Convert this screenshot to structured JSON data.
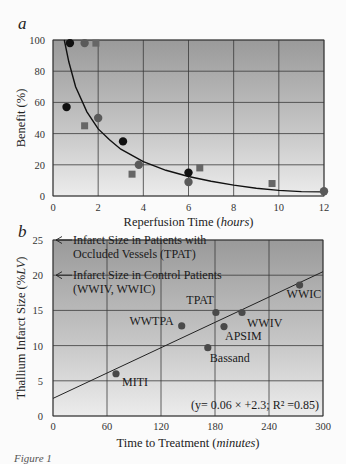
{
  "figure": {
    "caption_fragment": "Figure 1"
  },
  "chart_data": [
    {
      "panel": "a",
      "type": "scatter",
      "title": "",
      "xlabel": "Reperfusion Time (hours)",
      "xlabel_main": "Reperfusion Time (",
      "xlabel_italic": "hours",
      "xlabel_end": ")",
      "ylabel": "Benefit (%)",
      "xlim": [
        0,
        12
      ],
      "ylim": [
        0,
        100
      ],
      "xticks": [
        0,
        2,
        4,
        6,
        8,
        10,
        12
      ],
      "yticks": [
        0,
        20,
        40,
        60,
        80,
        100
      ],
      "grid": true,
      "series": [
        {
          "name": "black-circles",
          "marker": "circle",
          "color": "#111111",
          "points": [
            [
              0.75,
              98
            ],
            [
              0.6,
              57
            ],
            [
              3.1,
              35
            ],
            [
              6.0,
              15
            ]
          ]
        },
        {
          "name": "gray-circles",
          "marker": "circle",
          "color": "#5a5a5a",
          "points": [
            [
              1.4,
              98
            ],
            [
              2.0,
              50
            ],
            [
              3.8,
              20
            ],
            [
              6.0,
              9
            ],
            [
              12.0,
              3
            ]
          ]
        },
        {
          "name": "gray-squares",
          "marker": "square",
          "color": "#666666",
          "points": [
            [
              1.9,
              98
            ],
            [
              1.4,
              45
            ],
            [
              3.5,
              14
            ],
            [
              6.5,
              18
            ],
            [
              9.7,
              8
            ]
          ]
        }
      ],
      "fit_curve": {
        "type": "hyperbolic-decay",
        "points": [
          [
            0.5,
            100
          ],
          [
            0.7,
            86
          ],
          [
            1,
            70
          ],
          [
            1.5,
            54
          ],
          [
            2,
            43
          ],
          [
            2.5,
            36
          ],
          [
            3,
            30
          ],
          [
            4,
            22
          ],
          [
            5,
            16.5
          ],
          [
            6,
            12.5
          ],
          [
            7,
            9.5
          ],
          [
            8,
            7
          ],
          [
            9,
            5
          ],
          [
            10,
            3.6
          ],
          [
            11,
            2.8
          ],
          [
            12,
            2.6
          ]
        ]
      }
    },
    {
      "panel": "b",
      "type": "scatter",
      "title": "",
      "xlabel": "Time to Treatment (minutes)",
      "xlabel_main": "Time to Treatment (",
      "xlabel_italic": "minutes",
      "xlabel_end": ")",
      "ylabel": "Thallium Infarct Size (%LV)",
      "ylabel_main": "Thallium Infarct Size (%",
      "ylabel_italic": "LV",
      "ylabel_end": ")",
      "xlim": [
        0,
        300
      ],
      "ylim": [
        0,
        25
      ],
      "xticks": [
        0,
        60,
        120,
        180,
        240,
        300
      ],
      "yticks": [
        0,
        5,
        10,
        15,
        20,
        25
      ],
      "grid": true,
      "series": [
        {
          "name": "trials",
          "marker": "circle",
          "color": "#4a4a4a",
          "points": [
            {
              "label": "MITI",
              "x": 70,
              "y": 6.0
            },
            {
              "label": "WWTPA",
              "x": 143,
              "y": 12.8
            },
            {
              "label": "Bassand",
              "x": 172,
              "y": 9.7
            },
            {
              "label": "TPAT",
              "x": 181,
              "y": 14.7
            },
            {
              "label": "APSIM",
              "x": 190,
              "y": 12.7
            },
            {
              "label": "WWIV",
              "x": 210,
              "y": 14.7
            },
            {
              "label": "WWIC",
              "x": 274,
              "y": 18.6
            }
          ]
        }
      ],
      "regression": {
        "slope": 0.06,
        "intercept": 2.3,
        "r2": 0.85,
        "x_range": [
          0,
          300
        ]
      },
      "annotations": [
        {
          "text_line1": "Infarct Size in Patients with",
          "text_line2": "Occluded Vessels (TPAT)",
          "y": 25,
          "arrow": "left"
        },
        {
          "text_line1": "Infarct Size in Control Patients",
          "text_line2": "(WWIV, WWIC)",
          "y": 20,
          "arrow": "left"
        }
      ],
      "equation_label": "(y= 0.06 × +2.3; R² =0.85)"
    }
  ]
}
